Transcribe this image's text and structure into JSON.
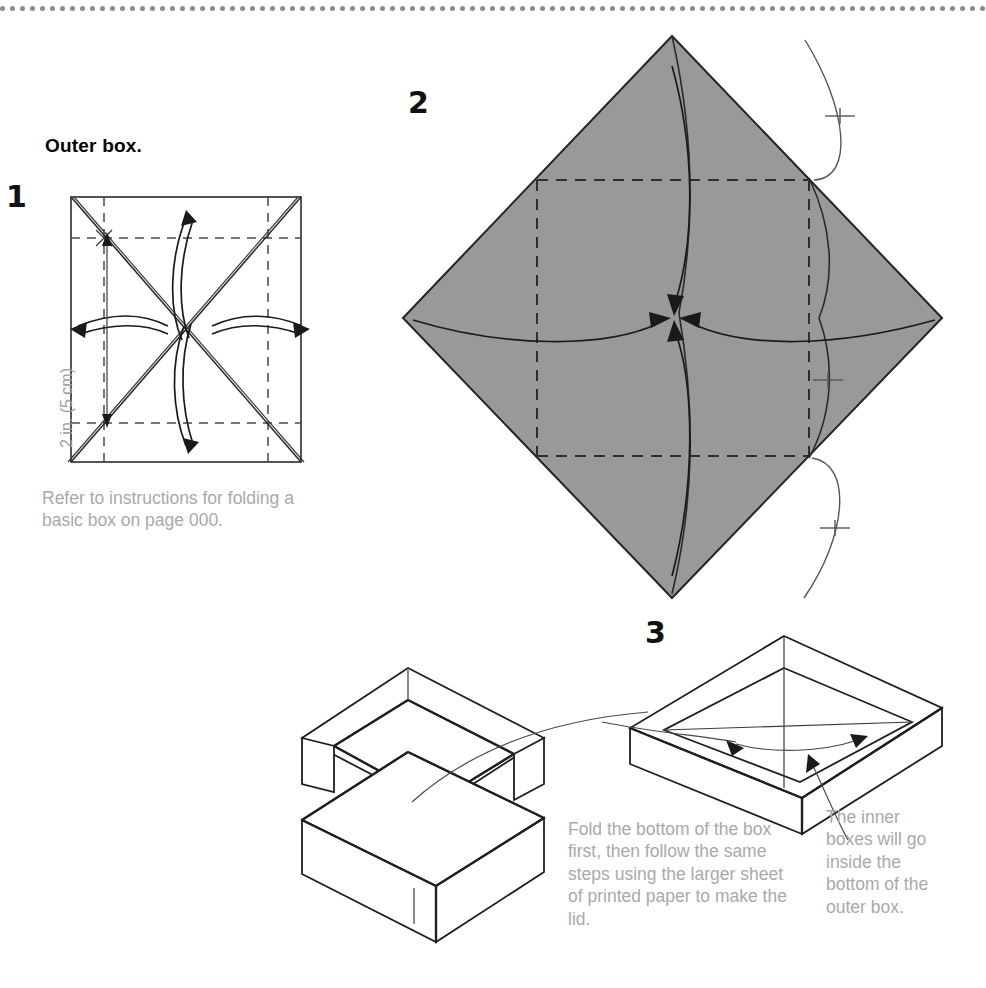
{
  "page": {
    "heading": "Outer box.",
    "top_rule": "dotted-divider"
  },
  "steps": [
    {
      "number": "1",
      "caption": "Refer to instructions for folding a basic box on page 000.",
      "measurement_label": "2 in. (5 cm)",
      "figure": "square-with-diagonals-and-fold-arrows"
    },
    {
      "number": "2",
      "caption": "",
      "figure": "gray-diamond-corners-folding-to-center"
    },
    {
      "number": "3",
      "caption_left": "Fold the bottom of the box first, then follow the same steps using the larger sheet of printed paper to make the lid.",
      "caption_right": "The inner boxes will go inside the bottom of the outer box.",
      "figure": "exploded-lid-and-base-plus-shallow-tray"
    }
  ],
  "colors": {
    "paper_gray": "#999999",
    "ink": "#1f1f1f",
    "caption_gray": "#a9a9a9",
    "rule_gray": "#8a8a8a"
  }
}
